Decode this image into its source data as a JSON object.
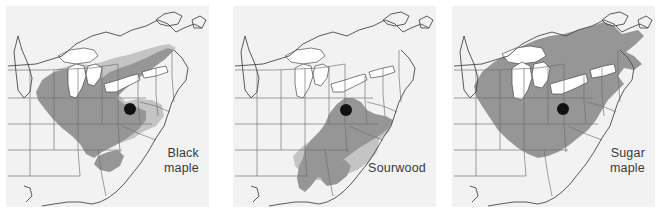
{
  "figure": {
    "type": "species-range-map-series",
    "region": "Eastern North America",
    "background_color": "#ffffff",
    "panel_background_color": "#f2f2f2",
    "panel_count": 3
  },
  "colors": {
    "range_primary": "#969696",
    "range_secondary": "#c4c4c4",
    "border_line": "#6e6e6e",
    "coast_line": "#4a4a4a",
    "lakes": "#ffffff",
    "locality_dot": "#111111",
    "label_text": "#3a3a3a"
  },
  "panels": [
    {
      "id": "panel-1",
      "label": "Black\nmaple",
      "label_lines": [
        "Black",
        "maple"
      ],
      "species_common_name": "Black maple",
      "locality_dot": {
        "x": 124,
        "y": 103,
        "radius": 6
      },
      "legend_shades": [
        "range_primary",
        "range_secondary"
      ]
    },
    {
      "id": "panel-2",
      "label": "Sourwood",
      "label_lines": [
        "Sourwood"
      ],
      "species_common_name": "Sourwood",
      "locality_dot": {
        "x": 113,
        "y": 104,
        "radius": 6
      },
      "legend_shades": [
        "range_primary",
        "range_secondary"
      ]
    },
    {
      "id": "panel-3",
      "label": "Sugar\nmaple",
      "label_lines": [
        "Sugar",
        "maple"
      ],
      "species_common_name": "Sugar maple",
      "locality_dot": {
        "x": 111,
        "y": 103,
        "radius": 6
      },
      "legend_shades": [
        "range_primary"
      ]
    }
  ]
}
